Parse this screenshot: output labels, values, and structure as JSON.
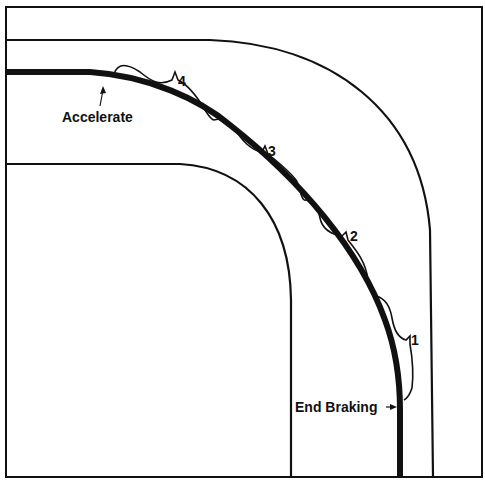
{
  "diagram": {
    "type": "racing-line-corner",
    "colors": {
      "ink": "#111111",
      "background": "#ffffff"
    },
    "labels": {
      "accelerate": "Accelerate",
      "end_braking": "End Braking",
      "segment_1": "1",
      "segment_2": "2",
      "segment_3": "3",
      "segment_4": "4"
    },
    "elements": [
      "frame",
      "outer-track-edge",
      "inner-track-edge",
      "racing-line",
      "segment-braces-1-to-4",
      "accelerate-arrow",
      "end-braking-arrow"
    ]
  }
}
